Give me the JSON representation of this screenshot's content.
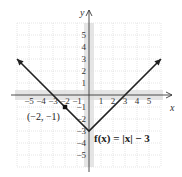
{
  "chart_data": {
    "type": "line",
    "title": "",
    "xlabel": "x",
    "ylabel": "y",
    "xlim": [
      -6,
      6
    ],
    "ylim": [
      -6,
      6
    ],
    "grid": true,
    "x_ticks": [
      -5,
      -4,
      -3,
      -2,
      -1,
      1,
      2,
      3,
      4,
      5
    ],
    "y_ticks": [
      5,
      4,
      3,
      2,
      1,
      -1,
      -2,
      -3,
      -4,
      -5
    ],
    "x_tick_labels": [
      "−5",
      "−4",
      "−3",
      "−2",
      "−1",
      "1",
      "2",
      "3",
      "4",
      "5"
    ],
    "y_tick_labels": [
      "5",
      "4",
      "3",
      "2",
      "1",
      "−1",
      "−2",
      "−3",
      "−4",
      "−5"
    ],
    "series": [
      {
        "name": "f(x) = |x| − 3",
        "x": [
          -6,
          0,
          6
        ],
        "y": [
          3,
          -3,
          3
        ],
        "arrows": "both-ends"
      }
    ],
    "points": [
      {
        "x": -2,
        "y": -1,
        "label": "(−2, −1)"
      }
    ],
    "annotations": [
      {
        "text": "f(x) = |x| − 3",
        "near": "bottom-right of vertex"
      }
    ]
  },
  "labels": {
    "function": "f(x) = |x| − 3",
    "point": "(−2, −1)",
    "x_axis": "x",
    "y_axis": "y"
  }
}
